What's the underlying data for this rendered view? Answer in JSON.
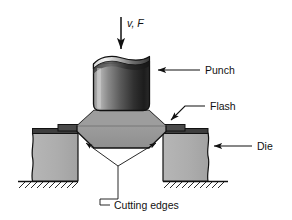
{
  "figure": {
    "background_color": "#ffffff"
  },
  "labels": {
    "force": "v, F",
    "punch": "Punch",
    "flash": "Flash",
    "die": "Die",
    "cutting_edges": "Cutting edges"
  },
  "parts": {
    "punch": {
      "name": "Punch",
      "fill_light": "#c9c9c9",
      "fill_dark": "#1d1d1d"
    },
    "workpiece": {
      "name": "Workpiece",
      "fill": "#9a9a9a",
      "stroke": "#111111"
    },
    "flash": {
      "name": "Flash",
      "fill": "#4a4a4a"
    },
    "die_left": {
      "name": "Left die block",
      "fill": "#b0b0b0",
      "cap_fill": "#3d3d3d"
    },
    "die_right": {
      "name": "Right die block",
      "fill": "#b0b0b0",
      "cap_fill": "#3d3d3d"
    },
    "ground": {
      "name": "Ground hatching",
      "stroke": "#111111"
    }
  },
  "annotations": {
    "force_arrow": "downward arrow indicating velocity and force",
    "punch_arrow": "leader arrow pointing left at punch",
    "flash_arrow": "leader arrow pointing down-left at flash",
    "die_arrow": "leader arrow pointing left at right die block",
    "cutting_edges_leaders": "two leaders converging to die cutting corners"
  }
}
